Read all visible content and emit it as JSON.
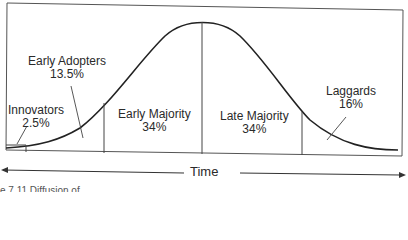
{
  "diagram": {
    "axis": {
      "label": "Time"
    },
    "categories": [
      {
        "name": "Innovators",
        "share": "2.5%"
      },
      {
        "name": "Early Adopters",
        "share": "13.5%"
      },
      {
        "name": "Early Majority",
        "share": "34%"
      },
      {
        "name": "Late Majority",
        "share": "34%"
      },
      {
        "name": "Laggards",
        "share": "16%"
      }
    ],
    "caption": "e 7.11 Diffusion of"
  }
}
